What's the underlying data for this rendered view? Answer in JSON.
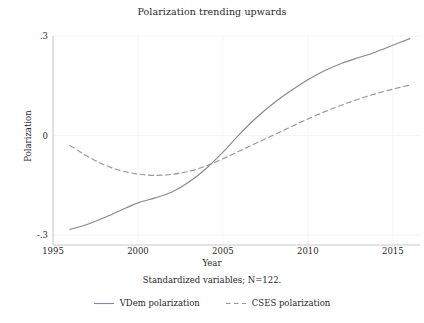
{
  "chart_data": {
    "type": "line",
    "title": "Polarization trending upwards",
    "xlabel": "Year",
    "ylabel": "Polarization",
    "note": "Standardized variables; N=122.",
    "xlim": [
      1995,
      2016.6
    ],
    "ylim": [
      -0.33,
      0.3
    ],
    "xticks": [
      1995,
      2000,
      2005,
      2010,
      2015
    ],
    "xtick_labels": [
      "1995",
      "2000",
      "2005",
      "2010",
      "2015"
    ],
    "yticks": [
      -0.3,
      0,
      0.3
    ],
    "ytick_labels": [
      "-.3",
      "0",
      ".3"
    ],
    "grid": "faint-horizontal-and-vertical",
    "legend_position": "below-plot",
    "series": [
      {
        "name": "VDem polarization",
        "style": "solid",
        "color": "#8d8596",
        "x": [
          1996.0,
          1997.0,
          1998.0,
          1999.0,
          2000.0,
          2001.0,
          2002.0,
          2003.0,
          2004.0,
          2005.0,
          2006.0,
          2007.0,
          2008.0,
          2009.0,
          2010.0,
          2011.0,
          2012.0,
          2013.0,
          2014.0,
          2015.0,
          2016.0
        ],
        "values": [
          -0.283,
          -0.268,
          -0.248,
          -0.225,
          -0.203,
          -0.188,
          -0.17,
          -0.14,
          -0.1,
          -0.05,
          0.005,
          0.055,
          0.098,
          0.135,
          0.168,
          0.196,
          0.218,
          0.235,
          0.252,
          0.272,
          0.292
        ]
      },
      {
        "name": "CSES polarization",
        "style": "dashed",
        "color": "#9b93a3",
        "x": [
          1996.0,
          1997.0,
          1998.0,
          1999.0,
          2000.0,
          2001.0,
          2002.0,
          2003.0,
          2004.0,
          2005.0,
          2006.0,
          2007.0,
          2008.0,
          2009.0,
          2010.0,
          2011.0,
          2012.0,
          2013.0,
          2014.0,
          2015.0,
          2016.0
        ],
        "values": [
          -0.03,
          -0.062,
          -0.088,
          -0.106,
          -0.116,
          -0.12,
          -0.117,
          -0.108,
          -0.092,
          -0.07,
          -0.046,
          -0.022,
          0.002,
          0.026,
          0.05,
          0.072,
          0.092,
          0.11,
          0.126,
          0.14,
          0.152
        ]
      }
    ]
  },
  "legend": {
    "entries": [
      {
        "label": "VDem polarization",
        "style": "solid"
      },
      {
        "label": "CSES polarization",
        "style": "dashed"
      }
    ]
  },
  "colors": {
    "line_primary": "#8d8596",
    "line_secondary": "#9b93a3",
    "axis": "#c9c9cf",
    "grid": "#f4f4f6",
    "text": "#1f1f1f",
    "background": "#ffffff"
  }
}
